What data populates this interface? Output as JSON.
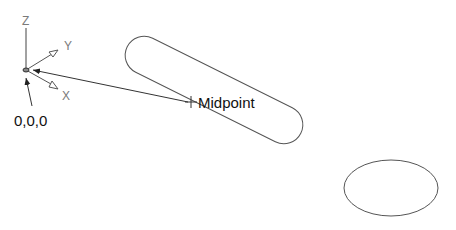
{
  "diagram": {
    "axes": {
      "z_label": "Z",
      "y_label": "Y",
      "x_label": "X",
      "origin_label": "0,0,0"
    },
    "midpoint_label": "Midpoint",
    "shapes": [
      "slot",
      "ellipse"
    ],
    "colors": {
      "line": "#555555",
      "leader": "#333333",
      "axis_label": "#7a7a7a",
      "text": "#111111",
      "background": "#ffffff"
    }
  }
}
